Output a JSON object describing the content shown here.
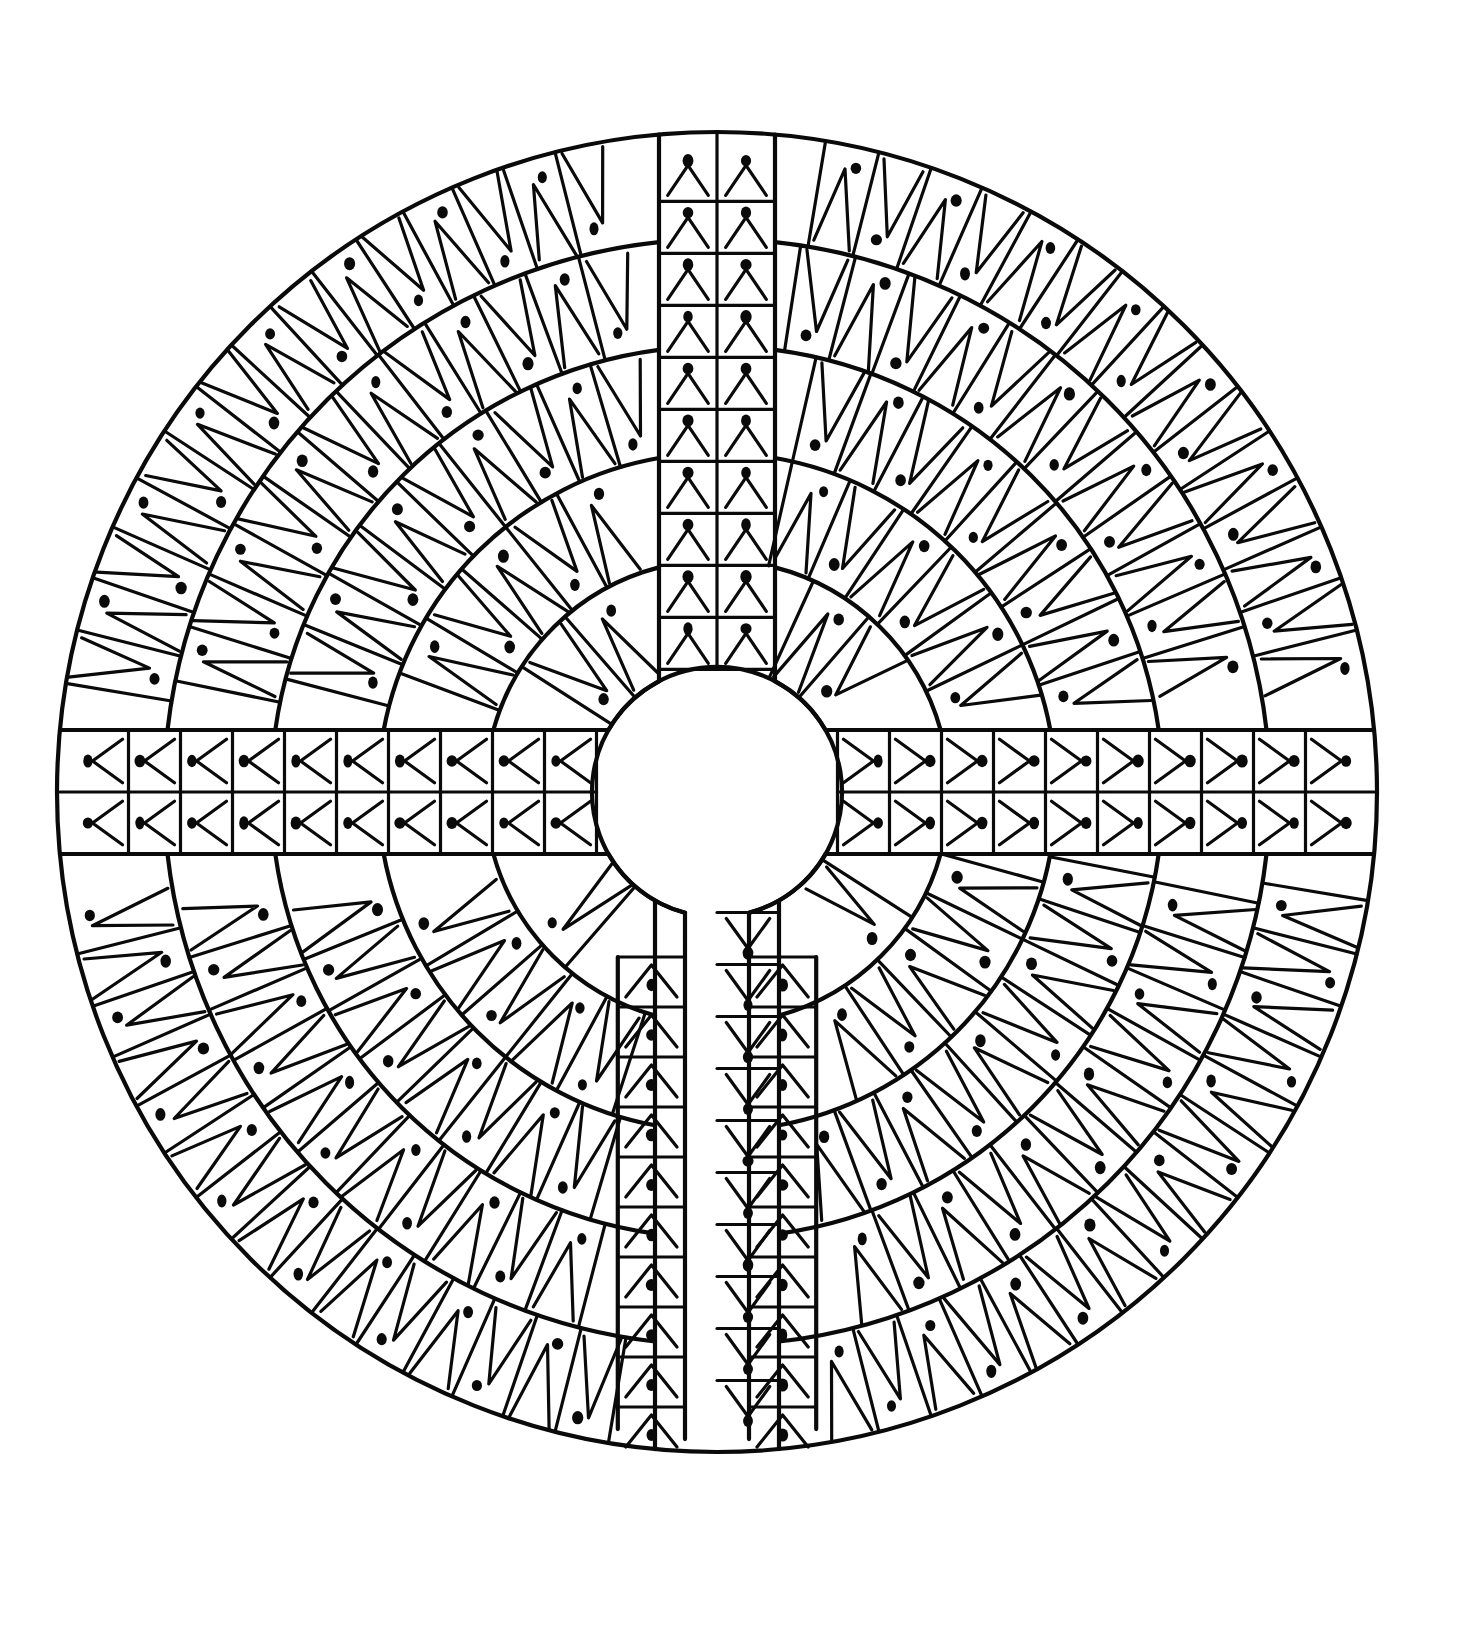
{
  "artwork": {
    "type": "labyrinth-mandala-coloring-page",
    "canvas": {
      "width": 1476,
      "height": 1632,
      "background": "#ffffff"
    },
    "ink_color": "#0a0a0a",
    "center": {
      "x": 717,
      "y": 792
    },
    "outer_radius": 660,
    "inner_hole_radius": 125,
    "ring_count": 5,
    "arms": [
      {
        "name": "top-arm",
        "direction": "up",
        "half_width": 58
      },
      {
        "name": "left-arm",
        "direction": "left",
        "half_width": 62
      },
      {
        "name": "right-arm",
        "direction": "right",
        "half_width": 62
      },
      {
        "name": "bottom-arm",
        "direction": "down",
        "half_width": 62
      }
    ],
    "entrance": {
      "direction": "down",
      "gap_width": 64
    },
    "pattern": "triangle-and-dot tessellation"
  }
}
